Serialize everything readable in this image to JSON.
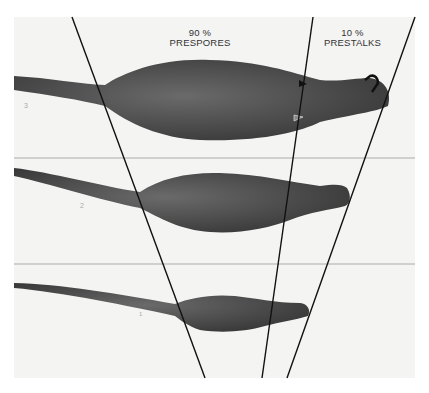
{
  "figure": {
    "labels": {
      "prespore_percent": "90 %",
      "prespore_name": "PRESPORES",
      "prestalk_percent": "10 %",
      "prestalk_name": "PRESTALKS"
    },
    "panel_marks": [
      "3",
      "2",
      "1"
    ],
    "colors": {
      "background": "#f4f4f2",
      "slug_body": "#4a4a4a",
      "lines": "#111111",
      "divider": "#999999"
    },
    "annotations": {
      "arrow": "curved-arrow-at-tip",
      "arrowheads": [
        "upper-arrowhead-filled",
        "lower-arrowhead-outlined"
      ]
    }
  }
}
